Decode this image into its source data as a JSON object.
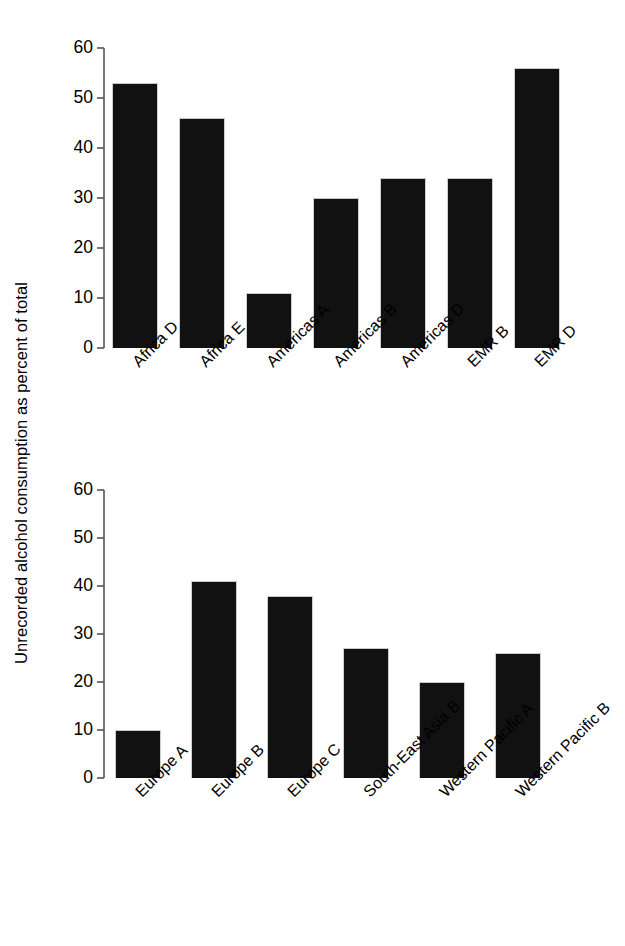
{
  "chart_data": [
    {
      "type": "bar",
      "panel": "top",
      "title": "",
      "xlabel": "",
      "ylabel": "Unrecorded alcohol consumption as percent of total",
      "ylim": [
        0,
        60
      ],
      "yticks": [
        0,
        10,
        20,
        30,
        40,
        50,
        60
      ],
      "grid": false,
      "legend": "none",
      "categories": [
        "Africa D",
        "Africa E",
        "Americas A",
        "Americas B",
        "Americas D",
        "EMR B",
        "EMR D"
      ],
      "values": [
        53,
        46,
        11,
        30,
        34,
        34,
        56
      ]
    },
    {
      "type": "bar",
      "panel": "bottom",
      "title": "",
      "xlabel": "",
      "ylabel": "Unrecorded alcohol consumption as percent of total",
      "ylim": [
        0,
        60
      ],
      "yticks": [
        0,
        10,
        20,
        30,
        40,
        50,
        60
      ],
      "grid": false,
      "legend": "none",
      "categories": [
        "Europe A",
        "Europe B",
        "Europe C",
        "South-East Asia B",
        "Western Pacific A",
        "Western Pacific B"
      ],
      "values": [
        10,
        41,
        38,
        27,
        20,
        26
      ]
    }
  ],
  "axis": {
    "y_title": "Unrecorded alcohol consumption as percent of total",
    "tick_labels": [
      "60",
      "50",
      "40",
      "30",
      "20",
      "10",
      "0"
    ]
  },
  "top": {
    "ticks": [
      "60",
      "50",
      "40",
      "30",
      "20",
      "10",
      "0"
    ],
    "bars": [
      {
        "label": "Africa D",
        "value": "53"
      },
      {
        "label": "Africa E",
        "value": "46"
      },
      {
        "label": "Americas A",
        "value": "11"
      },
      {
        "label": "Americas B",
        "value": "30"
      },
      {
        "label": "Americas D",
        "value": "34"
      },
      {
        "label": "EMR B",
        "value": "34"
      },
      {
        "label": "EMR D",
        "value": "56"
      }
    ]
  },
  "bottom": {
    "ticks": [
      "60",
      "50",
      "40",
      "30",
      "20",
      "10",
      "0"
    ],
    "bars": [
      {
        "label": "Europe A",
        "value": "10"
      },
      {
        "label": "Europe B",
        "value": "41"
      },
      {
        "label": "Europe C",
        "value": "38"
      },
      {
        "label": "South-East Asia B",
        "value": "27"
      },
      {
        "label": "Western Pacific A",
        "value": "20"
      },
      {
        "label": "Western Pacific B",
        "value": "26"
      }
    ]
  },
  "style": {
    "bar_color": "#111111",
    "axis_color": "#555555",
    "text_color": "#000000",
    "background": "#ffffff"
  }
}
